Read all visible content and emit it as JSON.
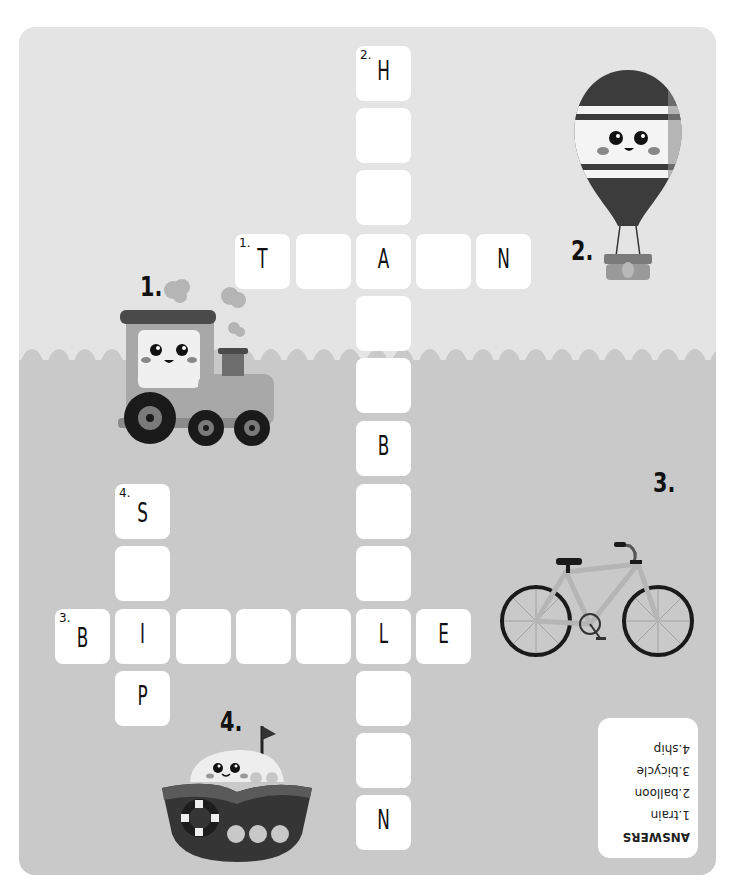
{
  "puzzle": {
    "type": "crossword",
    "colors": {
      "page_bg": "#ffffff",
      "top_bg": "#e4e4e4",
      "bottom_bg": "#c9c9c9",
      "tile": "#ffffff",
      "ink": "#111111"
    },
    "clue_labels": {
      "train": "1.",
      "balloon": "2.",
      "bicycle": "3.",
      "ship": "4."
    },
    "pictures": [
      {
        "id": "train",
        "label": "1.",
        "icon": "train-icon"
      },
      {
        "id": "balloon",
        "label": "2.",
        "icon": "hot-air-balloon-icon"
      },
      {
        "id": "bicycle",
        "label": "3.",
        "icon": "bicycle-icon"
      },
      {
        "id": "ship",
        "label": "4.",
        "icon": "ship-icon"
      }
    ],
    "words": [
      {
        "number": "1",
        "direction": "across",
        "answer": "TRAIN",
        "shown": [
          "T",
          "",
          "A",
          "",
          "N"
        ]
      },
      {
        "number": "2",
        "direction": "down",
        "answer": "HOT-AIR BALLOON",
        "shown": [
          "H",
          "",
          "",
          "A",
          "",
          "",
          "B",
          "",
          "",
          "L",
          "",
          "",
          "N"
        ]
      },
      {
        "number": "3",
        "direction": "across",
        "answer": "BICYCLE",
        "shown": [
          "B",
          "I",
          "",
          "",
          "",
          "L",
          "E"
        ]
      },
      {
        "number": "4",
        "direction": "down",
        "answer": "SHIP",
        "shown": [
          "S",
          "",
          "I",
          "P"
        ]
      }
    ],
    "tiles": {
      "c2_0": {
        "num": "2.",
        "letter": "H"
      },
      "c2_1": {
        "num": "",
        "letter": ""
      },
      "c2_2": {
        "num": "",
        "letter": ""
      },
      "c2_3": {
        "num": "",
        "letter": "A"
      },
      "c2_4": {
        "num": "",
        "letter": ""
      },
      "c2_5": {
        "num": "",
        "letter": ""
      },
      "c2_6": {
        "num": "",
        "letter": "B"
      },
      "c2_7": {
        "num": "",
        "letter": ""
      },
      "c2_8": {
        "num": "",
        "letter": ""
      },
      "c2_9": {
        "num": "",
        "letter": "L"
      },
      "c2_10": {
        "num": "",
        "letter": ""
      },
      "c2_11": {
        "num": "",
        "letter": ""
      },
      "c2_12": {
        "num": "",
        "letter": "N"
      },
      "r1_0": {
        "num": "1.",
        "letter": "T"
      },
      "r1_1": {
        "num": "",
        "letter": ""
      },
      "r1_3": {
        "num": "",
        "letter": ""
      },
      "r1_4": {
        "num": "",
        "letter": "N"
      },
      "r3_0": {
        "num": "3.",
        "letter": "B"
      },
      "r3_1": {
        "num": "",
        "letter": "I"
      },
      "r3_2": {
        "num": "",
        "letter": ""
      },
      "r3_3": {
        "num": "",
        "letter": ""
      },
      "r3_4": {
        "num": "",
        "letter": ""
      },
      "r3_6": {
        "num": "",
        "letter": "E"
      },
      "c4_0": {
        "num": "4.",
        "letter": "S"
      },
      "c4_1": {
        "num": "",
        "letter": ""
      },
      "c4_3": {
        "num": "",
        "letter": "P"
      }
    },
    "answers_box": {
      "title": "ANSWERS",
      "items": [
        "1.train",
        "2.balloon",
        "3.bicycle",
        "4.ship"
      ],
      "orientation": "upside-down"
    }
  }
}
